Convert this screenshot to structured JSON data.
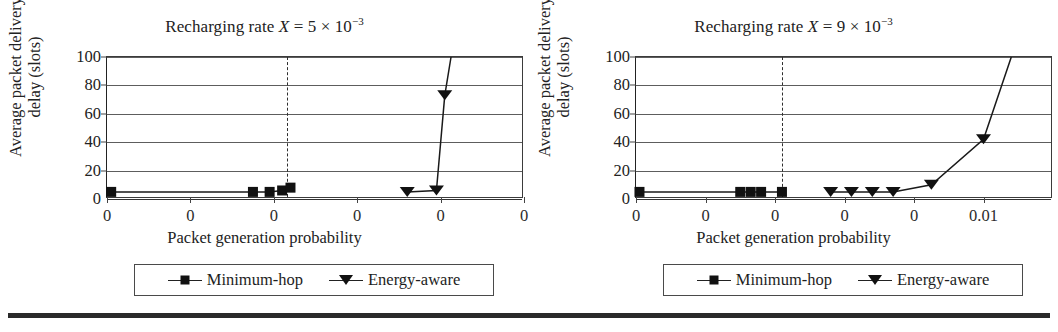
{
  "figure": {
    "bottom_rule": true,
    "ink_color": "#1a1a1a"
  },
  "panels": [
    {
      "id": "left",
      "title_prefix": "Recharging rate ",
      "title_var": "X",
      "title_value": " = 5 × 10",
      "title_exp": "−3",
      "ylabel": "Average packet delivery delay (slots)",
      "xlabel": "Packet generation probability",
      "legend": [
        {
          "label": "Minimum-hop",
          "marker": "square"
        },
        {
          "label": "Energy-aware",
          "marker": "triangle"
        }
      ]
    },
    {
      "id": "right",
      "title_prefix": "Recharging rate ",
      "title_var": "X",
      "title_value": " = 9 × 10",
      "title_exp": "−3",
      "ylabel": "Average packet delivery delay (slots)",
      "xlabel": "Packet generation probability",
      "legend": [
        {
          "label": "Minimum-hop",
          "marker": "square"
        },
        {
          "label": "Energy-aware",
          "marker": "triangle"
        }
      ]
    }
  ],
  "chart_data": [
    {
      "type": "line",
      "id": "left-chart",
      "title": "Recharging rate X = 5 × 10−3",
      "xlabel": "Packet generation probability",
      "ylabel": "Average packet delivery delay (slots)",
      "xlim": [
        0,
        0.01
      ],
      "ylim": [
        0,
        100
      ],
      "yticks": [
        0,
        20,
        40,
        60,
        80,
        100
      ],
      "xticks": [
        0,
        0.002,
        0.004,
        0.006,
        0.008,
        0.01
      ],
      "xticklabels": [
        "0",
        "0",
        "0",
        "0",
        "0",
        "0"
      ],
      "grid": "horizontal",
      "legend_position": "below",
      "annotations": [
        {
          "type": "vline",
          "style": "dash-dot",
          "x": 0.0043
        }
      ],
      "series": [
        {
          "name": "Minimum-hop",
          "marker": "square",
          "x": [
            0.0001,
            0.0035,
            0.0039,
            0.0042,
            0.0044
          ],
          "y": [
            5,
            5,
            5,
            6,
            8
          ]
        },
        {
          "name": "Energy-aware",
          "marker": "triangle",
          "x": [
            0.0072,
            0.0079,
            0.0081,
            0.00825
          ],
          "y": [
            5,
            6,
            73,
            100
          ]
        }
      ]
    },
    {
      "type": "line",
      "id": "right-chart",
      "title": "Recharging rate X = 9 × 10−3",
      "xlabel": "Packet generation probability",
      "ylabel": "Average packet delivery delay (slots)",
      "xlim": [
        0,
        0.012
      ],
      "ylim": [
        0,
        100
      ],
      "yticks": [
        0,
        20,
        40,
        60,
        80,
        100
      ],
      "xticks": [
        0,
        0.002,
        0.004,
        0.006,
        0.008,
        0.01
      ],
      "xticklabels": [
        "0",
        "0",
        "0",
        "0",
        "0",
        "0.01"
      ],
      "grid": "horizontal",
      "legend_position": "below",
      "annotations": [
        {
          "type": "vline",
          "style": "dash-dot",
          "x": 0.0042
        }
      ],
      "series": [
        {
          "name": "Minimum-hop",
          "marker": "square",
          "x": [
            0.0001,
            0.003,
            0.0033,
            0.0036,
            0.0042
          ],
          "y": [
            5,
            5,
            5,
            5,
            5
          ]
        },
        {
          "name": "Energy-aware",
          "marker": "triangle",
          "x": [
            0.0056,
            0.0062,
            0.0068,
            0.0074,
            0.0085,
            0.01,
            0.0108
          ],
          "y": [
            5,
            5,
            5,
            5,
            10,
            42,
            100
          ]
        }
      ]
    }
  ]
}
